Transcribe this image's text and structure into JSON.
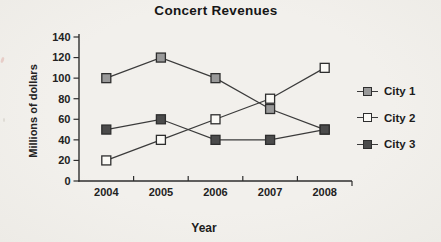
{
  "figure": {
    "background_color": "#f1efeb",
    "text_color": "#222222",
    "axis_color": "#2e2e2e"
  },
  "chart_data": {
    "type": "line",
    "title": "Concert Revenues",
    "xlabel": "Year",
    "ylabel": "Millions of dollars",
    "categories": [
      "2004",
      "2005",
      "2006",
      "2007",
      "2008"
    ],
    "y_ticks": [
      0,
      20,
      40,
      60,
      80,
      100,
      120,
      140
    ],
    "ylim": [
      0,
      140
    ],
    "grid": false,
    "legend_position": "right",
    "line_color": "#3b3b3b",
    "series": [
      {
        "name": "City 1",
        "values": [
          100,
          120,
          100,
          70,
          50
        ],
        "marker": "filled-square",
        "marker_fill": "#999999",
        "marker_border": "#2e2e2e"
      },
      {
        "name": "City 2",
        "values": [
          20,
          40,
          60,
          80,
          110
        ],
        "marker": "open-square",
        "marker_fill": "#fbfaf6",
        "marker_border": "#2e2e2e"
      },
      {
        "name": "City 3",
        "values": [
          50,
          60,
          40,
          40,
          50
        ],
        "marker": "filled-square",
        "marker_fill": "#4b4b4b",
        "marker_border": "#2e2e2e"
      }
    ]
  }
}
